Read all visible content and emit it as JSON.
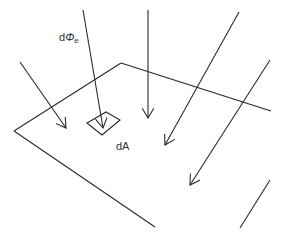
{
  "diagram": {
    "stroke_color": "#2a2a2a",
    "labels": {
      "flux": {
        "prefix": "d",
        "symbol": "Φ",
        "subscript": "e"
      },
      "area": "dA"
    },
    "plane": {
      "edges": [
        {
          "from": [
            121,
            63
          ],
          "to": [
            271,
            111
          ]
        },
        {
          "from": [
            121,
            63
          ],
          "to": [
            14,
            131
          ]
        },
        {
          "from": [
            14,
            131
          ],
          "to": [
            155,
            227
          ]
        }
      ]
    },
    "surface_element": {
      "corners": [
        [
          87,
          123
        ],
        [
          106,
          112
        ],
        [
          120,
          120
        ],
        [
          102,
          135
        ]
      ]
    },
    "arrows": [
      {
        "from": [
          20,
          62
        ],
        "to": [
          66,
          128
        ]
      },
      {
        "from": [
          83,
          10
        ],
        "to": [
          103,
          128
        ]
      },
      {
        "from": [
          148,
          10
        ],
        "to": [
          148,
          118
        ]
      },
      {
        "from": [
          239,
          12
        ],
        "to": [
          165,
          145
        ]
      },
      {
        "from": [
          270,
          60
        ],
        "to": [
          190,
          185
        ]
      }
    ],
    "lines": [
      {
        "from": [
          270,
          180
        ],
        "to": [
          240,
          228
        ]
      }
    ]
  }
}
